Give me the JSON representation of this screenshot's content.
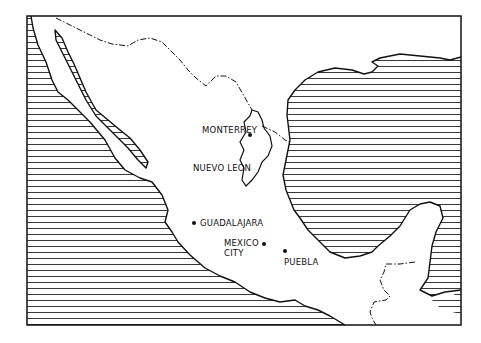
{
  "map": {
    "region": "Mexico",
    "labels": {
      "monterrey": "MONTERREY",
      "nuevo_leon": "NUEVO LEON",
      "guadalajara": "GUADALAJARA",
      "mexico_city_line1": "MEXICO",
      "mexico_city_line2": "CITY",
      "puebla": "PUEBLA"
    },
    "legend": {
      "hatched": "sea",
      "dash_dot": "international border"
    },
    "colors": {
      "ink": "#111111",
      "paper": "#ffffff"
    }
  }
}
